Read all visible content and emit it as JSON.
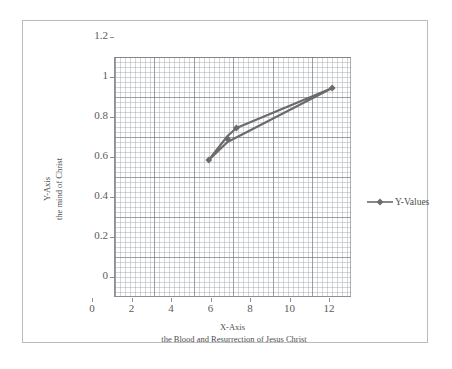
{
  "chart_data": {
    "type": "line",
    "title": "",
    "xlabel": "X-Axis",
    "xlabel_sub": "the Blood and Resurrection of Jesus Christ",
    "ylabel": "Y-Axis",
    "ylabel_sub": "the mind of Christ",
    "xlim": [
      0,
      12
    ],
    "ylim": [
      0,
      1.2
    ],
    "xticks": [
      "0",
      "2",
      "4",
      "6",
      "8",
      "10",
      "12"
    ],
    "xtick_values": [
      0,
      2,
      4,
      6,
      8,
      10,
      12
    ],
    "yticks": [
      "0",
      "0.2",
      "0.4",
      "0.6",
      "0.8",
      "1",
      "1.2"
    ],
    "ytick_values": [
      0,
      0.2,
      0.4,
      0.6,
      0.8,
      1.0,
      1.2
    ],
    "grid": "major and minor gridlines, both axes",
    "minor_x_step": 0.25,
    "minor_y_step": 0.025,
    "legend_position": "right",
    "legend": [
      "Y-Values"
    ],
    "series": [
      {
        "name": "Y-Values",
        "color": "#6b6b6b",
        "marker": "diamond",
        "points": [
          {
            "x": 4.8,
            "y": 0.685
          },
          {
            "x": 5.75,
            "y": 0.805
          },
          {
            "x": 6.2,
            "y": 0.845
          },
          {
            "x": 11.05,
            "y": 1.045
          },
          {
            "x": 5.75,
            "y": 0.775
          },
          {
            "x": 4.8,
            "y": 0.685
          }
        ],
        "marker_points": [
          {
            "x": 4.8,
            "y": 0.685
          },
          {
            "x": 5.75,
            "y": 0.79
          },
          {
            "x": 6.2,
            "y": 0.845
          },
          {
            "x": 11.05,
            "y": 1.045
          }
        ]
      }
    ]
  },
  "axes": {
    "x_title": "X-Axis",
    "x_subtitle": "the Blood and Resurrection of Jesus Christ",
    "y_title": "Y-Axis",
    "y_subtitle": "the mind of Christ"
  },
  "legend": {
    "series_label": "Y-Values"
  },
  "colors": {
    "series": "#6b6b6b",
    "frame": "#b9bcbe",
    "axis": "#8b8f93",
    "gridline_major": "#6e7378",
    "gridline_minor": "#a0a5aa",
    "text": "#4e4e4e",
    "background": "#ffffff"
  }
}
